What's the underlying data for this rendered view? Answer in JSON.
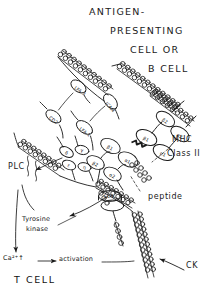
{
  "figure": {
    "type": "hand-drawn biological schematic",
    "ink_color": "#1a1a1a",
    "background_color": "#ffffff"
  },
  "header": {
    "line1": "ANTIGEN-",
    "line2": "PRESENTING",
    "line3": "CELL OR",
    "line4": "B CELL"
  },
  "cells": {
    "top_label": "ANTIGEN-PRESENTING CELL OR B CELL",
    "bottom_label": "T CELL"
  },
  "adhesion_molecules": [
    {
      "name": "LFA-3",
      "side": "apc"
    },
    {
      "name": "ICAM",
      "side": "apc"
    },
    {
      "name": "CD2",
      "side": "tcell"
    },
    {
      "name": "LFA-1",
      "side": "tcell"
    }
  ],
  "mhc": {
    "label_line1": "MHC",
    "label_line2": "Class II",
    "domains": [
      "β1",
      "β2",
      "α1",
      "α2"
    ],
    "peptide_label": "peptide"
  },
  "tcr": {
    "domains": [
      "β1",
      "β2",
      "α1",
      "α2"
    ],
    "cd3_chains": [
      "δ",
      "γ",
      "ε",
      "η"
    ],
    "cd4_label": "CD4"
  },
  "signaling": [
    {
      "id": "plc",
      "label": "PLC"
    },
    {
      "id": "tyrosine-kinase",
      "label_line1": "Tyrosine",
      "label_line2": "kinase"
    },
    {
      "id": "calcium",
      "label": "Ca²⁺↑"
    },
    {
      "id": "activation",
      "label": "activation"
    },
    {
      "id": "cytokine",
      "label": "CK"
    }
  ],
  "arrows": {
    "calcium_to_activation": "→"
  }
}
